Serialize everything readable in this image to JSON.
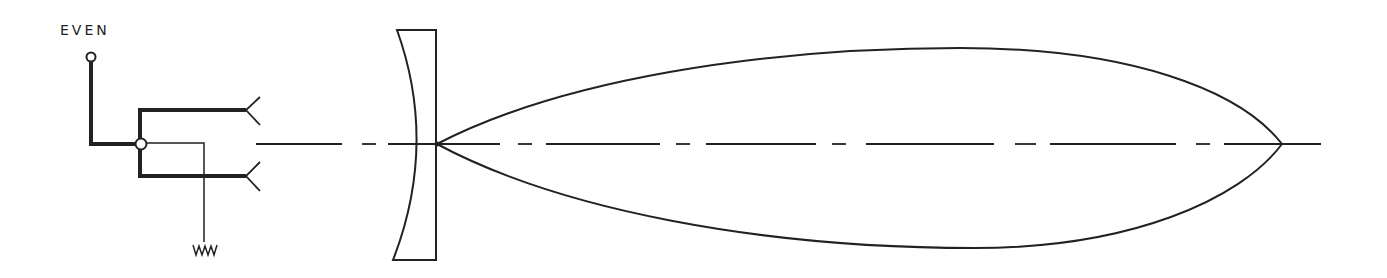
{
  "diagram": {
    "feed": {
      "terminal_label": "EVEN"
    },
    "colors": {
      "ink": "#222222",
      "background": "#ffffff"
    },
    "components": [
      {
        "name": "input-terminal",
        "label": "EVEN"
      },
      {
        "name": "hybrid-junction"
      },
      {
        "name": "upper-horn-feed"
      },
      {
        "name": "lower-horn-feed"
      },
      {
        "name": "matched-load-resistor"
      },
      {
        "name": "dielectric-lens"
      },
      {
        "name": "radiation-pattern-lobe"
      },
      {
        "name": "boresight-axis"
      }
    ]
  }
}
